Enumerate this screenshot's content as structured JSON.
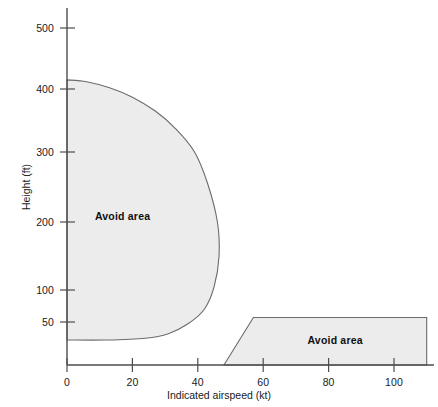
{
  "chart_data": {
    "type": "area",
    "title": "",
    "subtitle": "",
    "xlabel": "Indicated airspeed (kt)",
    "ylabel": "Height (ft)",
    "xlim": [
      -3,
      113
    ],
    "ylim": [
      0,
      530
    ],
    "grid": false,
    "legend_position": "none",
    "x_ticks": [
      {
        "value": 0,
        "label": "0"
      },
      {
        "value": 20,
        "label": "20"
      },
      {
        "value": 40,
        "label": "40"
      },
      {
        "value": 60,
        "label": "60"
      },
      {
        "value": 80,
        "label": "80"
      },
      {
        "value": 100,
        "label": "100"
      }
    ],
    "y_ticks": [
      {
        "value": 50,
        "label": "50"
      },
      {
        "value": 100,
        "label": "100"
      },
      {
        "value": 200,
        "label": "200"
      },
      {
        "value": 300,
        "label": "300"
      },
      {
        "value": 400,
        "label": "400"
      },
      {
        "value": 500,
        "label": "500"
      }
    ],
    "y_axis_note": "non-linear spacing between 50 and 100",
    "series": [
      {
        "name": "Avoid area (low speed / high hover height)",
        "label": "Avoid area",
        "label_x": 17,
        "label_y": 208,
        "fill": "#ececec",
        "stroke": "#6b6b6b",
        "boundary": [
          {
            "x": 0,
            "y": 415
          },
          {
            "x": 6,
            "y": 412
          },
          {
            "x": 13,
            "y": 402
          },
          {
            "x": 20,
            "y": 387
          },
          {
            "x": 27,
            "y": 365
          },
          {
            "x": 33,
            "y": 338
          },
          {
            "x": 39,
            "y": 300
          },
          {
            "x": 43,
            "y": 255
          },
          {
            "x": 46,
            "y": 200
          },
          {
            "x": 46.5,
            "y": 150
          },
          {
            "x": 45,
            "y": 105
          },
          {
            "x": 42,
            "y": 70
          },
          {
            "x": 37,
            "y": 48
          },
          {
            "x": 31,
            "y": 37
          },
          {
            "x": 24,
            "y": 32
          },
          {
            "x": 12,
            "y": 30
          },
          {
            "x": 0,
            "y": 30
          }
        ]
      },
      {
        "name": "Avoid area (high speed / low height)",
        "label": "Avoid area",
        "label_x": 82,
        "label_y": 30,
        "fill": "#ececec",
        "stroke": "#6b6b6b",
        "boundary": [
          {
            "x": 48,
            "y": 0
          },
          {
            "x": 57,
            "y": 57
          },
          {
            "x": 110,
            "y": 57
          },
          {
            "x": 110,
            "y": 0
          }
        ]
      }
    ]
  },
  "axis": {
    "x_title": "Indicated airspeed (kt)",
    "y_title": "Height (ft)",
    "axis_color": "#4d4d4d"
  },
  "labels": {
    "avoid_area_left": "Avoid area",
    "avoid_area_right": "Avoid area"
  }
}
